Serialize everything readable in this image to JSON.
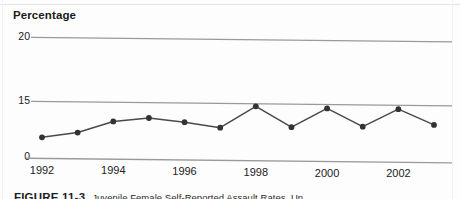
{
  "figure": {
    "caption_label": "FIGURE 11-3",
    "caption_text": "Juvenile Female Self-Reported Assault Rates, Un"
  },
  "colors": {
    "line": "#4a4a4a",
    "marker": "#333333",
    "gridline": "#9a9a9a",
    "text": "#222222",
    "background": "#fdfdfd"
  },
  "chart_data": {
    "type": "line",
    "title": "",
    "subtitle": "",
    "xlabel": "",
    "ylabel": "Percentage",
    "ylim": [
      0,
      20
    ],
    "y_ticks": [
      0,
      15,
      20
    ],
    "y_tick_labels": [
      "0",
      "15",
      "20"
    ],
    "y_axis_broken": true,
    "grid": true,
    "grid_axis": "y",
    "legend": false,
    "legend_position": "none",
    "marker": "circle",
    "x": [
      1992,
      1993,
      1994,
      1995,
      1996,
      1997,
      1998,
      1999,
      2000,
      2001,
      2002,
      2003
    ],
    "x_tick_labels": [
      "1992",
      "1994",
      "1996",
      "1998",
      "2000",
      "2002"
    ],
    "x_ticks": [
      1992,
      1994,
      1996,
      1998,
      2000,
      2002
    ],
    "xlim": [
      1991.5,
      2003.5
    ],
    "categories": [
      "1992",
      "1993",
      "1994",
      "1995",
      "1996",
      "1997",
      "1998",
      "1999",
      "2000",
      "2001",
      "2002",
      "2003"
    ],
    "values": [
      17.8,
      17.4,
      16.5,
      16.2,
      16.5,
      16.9,
      15.2,
      16.8,
      15.3,
      16.7,
      15.3,
      16.5
    ]
  }
}
